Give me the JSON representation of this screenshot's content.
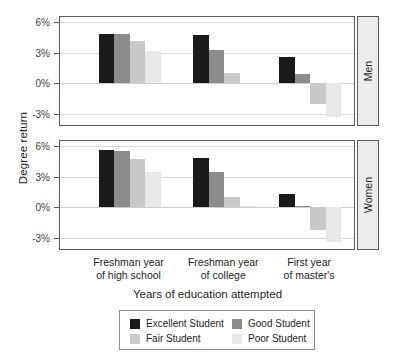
{
  "chart_data": {
    "type": "bar",
    "title": "",
    "subtitle": "",
    "xlabel": "Years of education attempted",
    "ylabel": "Degree return",
    "ylim": [
      -4.2,
      6.6
    ],
    "yticks": [
      "6%",
      "3%",
      "0%",
      "-3%"
    ],
    "ytick_values": [
      6,
      3,
      0,
      -3
    ],
    "grid": true,
    "legend_position": "bottom",
    "categories": [
      "Freshman year of high school",
      "Freshman year of college",
      "First year of master's"
    ],
    "category_lines": [
      [
        "Freshman year",
        "of high school"
      ],
      [
        "Freshman year",
        "of college"
      ],
      [
        "First year",
        "of master's"
      ]
    ],
    "facets": [
      {
        "name": "Men",
        "series": [
          {
            "name": "Excellent Student",
            "values": [
              4.8,
              4.7,
              2.6
            ]
          },
          {
            "name": "Good Student",
            "values": [
              4.8,
              3.3,
              0.9
            ]
          },
          {
            "name": "Fair Student",
            "values": [
              4.1,
              1.0,
              -2.0
            ]
          },
          {
            "name": "Poor Student",
            "values": [
              3.2,
              0.0,
              -3.3
            ]
          }
        ]
      },
      {
        "name": "Women",
        "series": [
          {
            "name": "Excellent Student",
            "values": [
              5.6,
              4.8,
              1.3
            ]
          },
          {
            "name": "Good Student",
            "values": [
              5.5,
              3.5,
              0.1
            ]
          },
          {
            "name": "Fair Student",
            "values": [
              4.7,
              1.0,
              -2.2
            ]
          },
          {
            "name": "Poor Student",
            "values": [
              3.5,
              0.1,
              -3.4
            ]
          }
        ]
      }
    ],
    "colors": {
      "Excellent Student": "#1a1a1a",
      "Good Student": "#8c8c8c",
      "Fair Student": "#c9c9c9",
      "Poor Student": "#e8e8e8"
    }
  },
  "legend": {
    "entries": [
      {
        "label": "Excellent Student",
        "color": "#1a1a1a"
      },
      {
        "label": "Good Student",
        "color": "#8c8c8c"
      },
      {
        "label": "Fair Student",
        "color": "#c9c9c9"
      },
      {
        "label": "Poor Student",
        "color": "#e8e8e8"
      }
    ]
  }
}
